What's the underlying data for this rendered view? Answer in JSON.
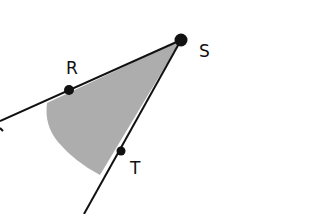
{
  "diagram": {
    "type": "angle",
    "vertex": {
      "label": "S"
    },
    "points": [
      {
        "id": "R",
        "label": "R"
      },
      {
        "id": "S",
        "label": "S"
      },
      {
        "id": "T",
        "label": "T"
      }
    ],
    "rays": [
      {
        "from": "S",
        "through": "R"
      },
      {
        "from": "S",
        "through": "T"
      }
    ],
    "shaded_region": "interior of angle RST",
    "colors": {
      "line": "#111111",
      "shade": "#a9a9a9",
      "background": "#ffffff"
    }
  }
}
